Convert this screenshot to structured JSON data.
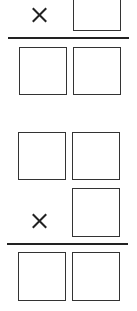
{
  "problems": [
    {
      "operator": "×",
      "multiplicand_boxes": 0,
      "multiplier_boxes": 1,
      "product_boxes": 2
    },
    {
      "operator": "×",
      "multiplicand_boxes": 2,
      "multiplier_boxes": 1,
      "product_boxes": 2
    }
  ],
  "colors": {
    "stroke": "#333333",
    "background": "#ffffff"
  }
}
